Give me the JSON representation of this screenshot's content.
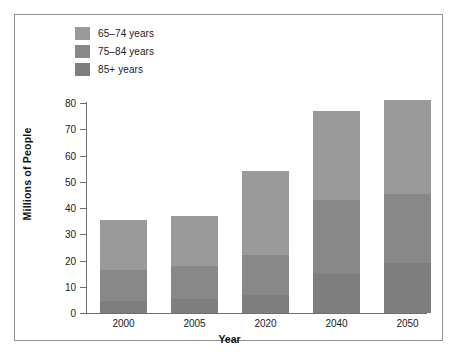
{
  "chart_data": {
    "type": "bar",
    "subtype": "stacked-bar",
    "title": "",
    "xlabel": "Year",
    "ylabel": "Millions of People",
    "categories": [
      "2000",
      "2005",
      "2020",
      "2040",
      "2050"
    ],
    "ylim": [
      0,
      80
    ],
    "yticks": [
      0,
      10,
      20,
      30,
      40,
      50,
      60,
      70,
      80
    ],
    "ytick_labels": [
      "0",
      "10",
      "20",
      "30",
      "40",
      "50",
      "60",
      "70",
      "80"
    ],
    "grid": false,
    "legend_position": "top-left",
    "series": [
      {
        "name": "65–74 years",
        "color": "#9a9a9a",
        "values": [
          19.0,
          19.0,
          32.0,
          34.0,
          35.5
        ]
      },
      {
        "name": "75–84 years",
        "color": "#888888",
        "values": [
          12.0,
          12.5,
          15.0,
          28.0,
          26.5
        ]
      },
      {
        "name": "85+ years",
        "color": "#7e7e7e",
        "values": [
          4.5,
          5.5,
          7.0,
          15.0,
          19.0
        ]
      }
    ],
    "totals": [
      35.5,
      37.0,
      54.0,
      77.0,
      81.0
    ],
    "stack_order_bottom_to_top": [
      "85+ years",
      "75–84 years",
      "65–74 years"
    ]
  },
  "legend": {
    "items": [
      {
        "label": "65–74 years",
        "color": "#9a9a9a"
      },
      {
        "label": "75–84 years",
        "color": "#888888"
      },
      {
        "label": "85+ years",
        "color": "#7e7e7e"
      }
    ]
  },
  "axes": {
    "y_title": "Millions of People",
    "x_title": "Year",
    "y_tick_labels": [
      "80",
      "70",
      "60",
      "50",
      "40",
      "30",
      "20",
      "10",
      "0"
    ],
    "x_tick_labels": [
      "2000",
      "2005",
      "2020",
      "2040",
      "2050"
    ]
  },
  "colors": {
    "axis": "#6f6f6f",
    "frame": "#8e8e8e",
    "text": "#1a1a1a",
    "background": "#ffffff"
  }
}
